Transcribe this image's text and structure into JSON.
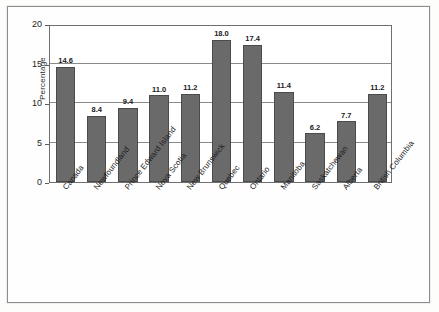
{
  "chart_data": {
    "type": "bar",
    "title": "",
    "subtitle": "",
    "xlabel": "",
    "ylabel": "Percentage",
    "ylim": [
      0,
      20
    ],
    "yticks": [
      0,
      5,
      10,
      15,
      20
    ],
    "ytick_labels": [
      "0",
      "5",
      "10",
      "15",
      "20"
    ],
    "grid": true,
    "legend": false,
    "legend_position": "none",
    "categories": [
      "Canada",
      "Newfoundland",
      "Prince Edward Island",
      "Nova Scotia",
      "New Brunswick",
      "Quebec",
      "Ontario",
      "Manitoba",
      "Saskatchewan",
      "Alberta",
      "British Columbia"
    ],
    "values": [
      14.6,
      8.4,
      9.4,
      11.0,
      11.2,
      18.0,
      17.4,
      11.4,
      6.2,
      7.7,
      11.2
    ],
    "data_labels": [
      "14.6",
      "8.4",
      "9.4",
      "11.0",
      "11.2",
      "18.0",
      "17.4",
      "11.4",
      "6.2",
      "7.7",
      "11.2"
    ],
    "bar_color": "#6a6a6a",
    "bar_edge_color": "#4b4b4b",
    "grid_color": "#8a8a8a",
    "axis_color": "#6f6f6f",
    "background_color": "#ffffff"
  }
}
